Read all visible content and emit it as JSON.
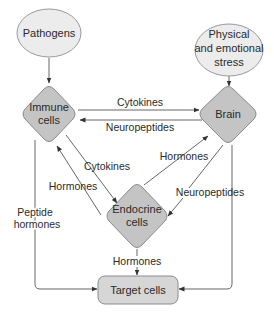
{
  "nodes": {
    "pathogens": {
      "label": "Pathogens"
    },
    "stress": {
      "line1": "Physical",
      "line2": "and emotional",
      "line3": "stress"
    },
    "immune": {
      "line1": "Immune",
      "line2": "cells"
    },
    "brain": {
      "label": "Brain"
    },
    "endocrine": {
      "line1": "Endocrine",
      "line2": "cells"
    },
    "target": {
      "label": "Target cells"
    }
  },
  "edges": {
    "immune_to_brain": "Cytokines",
    "brain_to_immune": "Neuropeptides",
    "immune_to_endocrine": "Cytokines",
    "endocrine_to_immune": "Hormones",
    "endocrine_to_brain": "Hormones",
    "brain_to_endocrine": "Neuropeptides",
    "immune_to_target_line1": "Peptide",
    "immune_to_target_line2": "hormones",
    "endocrine_to_target": "Hormones"
  },
  "colors": {
    "ellipse_fill": "#ececec",
    "diamond_fill": "#c4c4c4",
    "box_fill": "#d6d6d6",
    "line": "#555555"
  }
}
